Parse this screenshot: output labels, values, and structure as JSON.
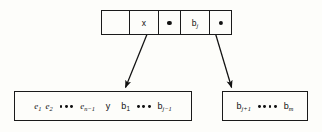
{
  "diagram": {
    "background_color": "#fdfdfa",
    "line_color": "#1a1a1a",
    "top_node": {
      "name": "parent-record",
      "cells": [
        {
          "id": "cell-empty-left",
          "label": "",
          "kind": "empty"
        },
        {
          "id": "cell-key-x",
          "label": "x",
          "kind": "key"
        },
        {
          "id": "cell-pointer-left",
          "label": "",
          "kind": "pointer"
        },
        {
          "id": "cell-key-bj",
          "label": "b",
          "subscript": "j",
          "kind": "key"
        },
        {
          "id": "cell-pointer-right",
          "label": "",
          "kind": "pointer"
        }
      ]
    },
    "bottom_left_node": {
      "name": "left-child-record",
      "tokens": [
        {
          "base": "e",
          "sub": "1",
          "style": "italic"
        },
        {
          "base": "e",
          "sub": "2",
          "style": "italic"
        },
        {
          "base": "dots",
          "count": 3
        },
        {
          "base": "e",
          "sub": "n−1",
          "style": "italic"
        },
        {
          "base": "y",
          "sub": "",
          "style": "upright"
        },
        {
          "base": "b",
          "sub": "1",
          "style": "upright"
        },
        {
          "base": "dots",
          "count": 3
        },
        {
          "base": "b",
          "sub": "j−1",
          "style": "upright"
        }
      ],
      "text": "e1 e2 ••• en−1  y  b1 ••• bj−1"
    },
    "bottom_right_node": {
      "name": "right-child-record",
      "tokens": [
        {
          "base": "b",
          "sub": "j+1",
          "style": "upright"
        },
        {
          "base": "dots",
          "count": 4
        },
        {
          "base": "b",
          "sub": "m",
          "style": "upright"
        }
      ],
      "text": "bj+1 •••• bm"
    },
    "arrows": [
      {
        "name": "arrow-to-left-child",
        "from": [
          152,
          21
        ],
        "to": [
          124,
          90
        ]
      },
      {
        "name": "arrow-to-right-child",
        "from": [
          212,
          21
        ],
        "to": [
          233,
          90
        ]
      }
    ]
  }
}
